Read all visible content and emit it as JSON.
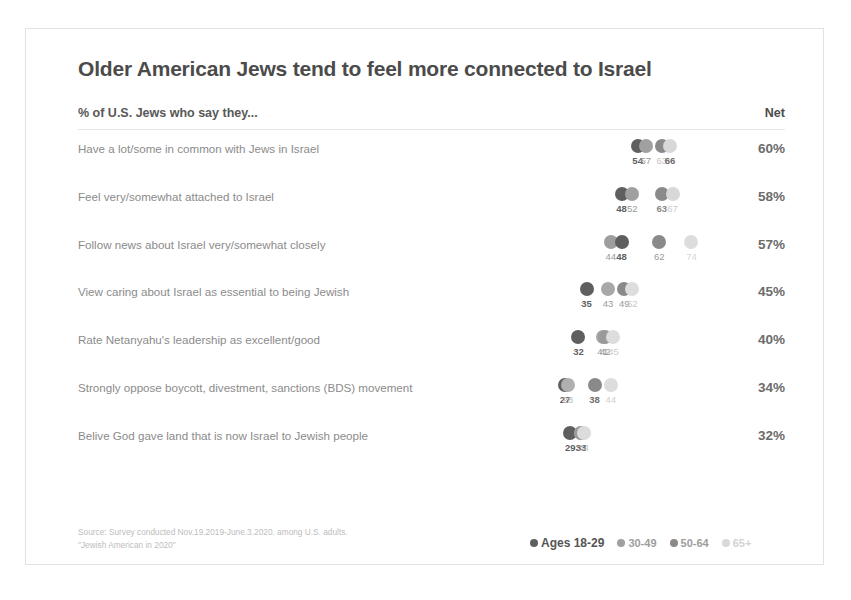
{
  "card": {
    "title": "Older American Jews tend to feel more connected to Israel",
    "subhead": "% of U.S. Jews who say they...",
    "net_header": "Net",
    "source_line1": "Source: Survey conducted Nov.19.2019-June.3.2020. among U.S. adults.",
    "source_line2": "\"Jewish American in 2020\""
  },
  "legend": {
    "items": [
      {
        "label": "Ages 18-29",
        "color": "#5f5f5f"
      },
      {
        "label": "30-49",
        "color": "#a0a0a0"
      },
      {
        "label": "50-64",
        "color": "#8a8a8a"
      },
      {
        "label": "65+",
        "color": "#d8d8d8"
      }
    ]
  },
  "chart_data": {
    "type": "scatter",
    "title": "Older American Jews tend to feel more connected to Israel",
    "subtitle": "% of U.S. Jews who say they...",
    "xlabel": "",
    "ylabel": "",
    "xlim": [
      0,
      100
    ],
    "grid": false,
    "legend_position": "bottom-right",
    "series": [
      {
        "name": "Ages 18-29",
        "color": "#5f5f5f",
        "values": [
          54,
          48,
          44,
          35,
          32,
          27,
          29
        ]
      },
      {
        "name": "30-49",
        "color": "#a0a0a0",
        "values": [
          57,
          52,
          48,
          43,
          41,
          28,
          33
        ]
      },
      {
        "name": "50-64",
        "color": "#8a8a8a",
        "values": [
          63,
          63,
          62,
          49,
          42,
          38,
          33
        ]
      },
      {
        "name": "65+",
        "color": "#d8d8d8",
        "values": [
          66,
          67,
          74,
          52,
          45,
          44,
          34
        ]
      }
    ],
    "categories": [
      "Have a lot/some in common with Jews in Israel",
      "Feel very/somewhat attached to Israel",
      "Follow news about Israel very/somewhat closely",
      "View caring about Israel as essential to being Jewish",
      "Rate Netanyahu's leadership as excellent/good",
      "Strongly oppose boycott, divestment, sanctions (BDS) movement",
      "Belive God gave land that is now Israel to Jewish people"
    ],
    "net": [
      "60%",
      "58%",
      "57%",
      "45%",
      "40%",
      "34%",
      "32%"
    ]
  },
  "rows": [
    {
      "label": "Have a lot/some in common with Jews in Israel",
      "net": "60%",
      "points": [
        {
          "group": "Ages 18-29",
          "value": 54,
          "color": "#5f5f5f",
          "label": "54",
          "label_color": "#5f5f5f",
          "bold": true
        },
        {
          "group": "30-49",
          "value": 57,
          "color": "#a0a0a0",
          "label": "57",
          "label_color": "#9a9a9a",
          "bold": false
        },
        {
          "group": "50-64",
          "value": 63,
          "color": "#8a8a8a",
          "label": "63",
          "label_color": "#c4c4c4",
          "bold": false
        },
        {
          "group": "65+",
          "value": 66,
          "color": "#d8d8d8",
          "label": "66",
          "label_color": "#6c6c6c",
          "bold": true
        }
      ]
    },
    {
      "label": "Feel very/somewhat attached to Israel",
      "net": "58%",
      "points": [
        {
          "group": "Ages 18-29",
          "value": 48,
          "color": "#5f5f5f",
          "label": "48",
          "label_color": "#5f5f5f",
          "bold": true
        },
        {
          "group": "30-49",
          "value": 52,
          "color": "#a0a0a0",
          "label": "52",
          "label_color": "#9a9a9a",
          "bold": false
        },
        {
          "group": "50-64",
          "value": 63,
          "color": "#8a8a8a",
          "label": "63",
          "label_color": "#8a8a8a",
          "bold": true
        },
        {
          "group": "65+",
          "value": 67,
          "color": "#d8d8d8",
          "label": "67",
          "label_color": "#cccccc",
          "bold": false
        }
      ]
    },
    {
      "label": "Follow news about Israel very/somewhat closely",
      "net": "57%",
      "points": [
        {
          "group": "Ages 18-29",
          "value": 44,
          "color": "#9e9e9e",
          "label": "44",
          "label_color": "#9a9a9a",
          "bold": false
        },
        {
          "group": "30-49",
          "value": 48,
          "color": "#5f5f5f",
          "label": "48",
          "label_color": "#5f5f5f",
          "bold": true
        },
        {
          "group": "50-64",
          "value": 62,
          "color": "#8a8a8a",
          "label": "62",
          "label_color": "#9a9a9a",
          "bold": false
        },
        {
          "group": "65+",
          "value": 74,
          "color": "#dddddd",
          "label": "74",
          "label_color": "#d5d5d5",
          "bold": false
        }
      ]
    },
    {
      "label": "View caring about Israel as essential to being Jewish",
      "net": "45%",
      "points": [
        {
          "group": "Ages 18-29",
          "value": 35,
          "color": "#5f5f5f",
          "label": "35",
          "label_color": "#5f5f5f",
          "bold": true
        },
        {
          "group": "30-49",
          "value": 43,
          "color": "#a8a8a8",
          "label": "43",
          "label_color": "#9a9a9a",
          "bold": false
        },
        {
          "group": "50-64",
          "value": 49,
          "color": "#8a8a8a",
          "label": "49",
          "label_color": "#9a9a9a",
          "bold": false
        },
        {
          "group": "65+",
          "value": 52,
          "color": "#dddddd",
          "label": "52",
          "label_color": "#c8c8c8",
          "bold": false
        }
      ]
    },
    {
      "label": "Rate Netanyahu's leadership as excellent/good",
      "net": "40%",
      "points": [
        {
          "group": "Ages 18-29",
          "value": 32,
          "color": "#5f5f5f",
          "label": "32",
          "label_color": "#5f5f5f",
          "bold": true
        },
        {
          "group": "30-49",
          "value": 41,
          "color": "#a8a8a8",
          "label": "41",
          "label_color": "#9a9a9a",
          "bold": false
        },
        {
          "group": "50-64",
          "value": 42,
          "color": "#9a9a9a",
          "label": "42",
          "label_color": "#9a9a9a",
          "bold": false
        },
        {
          "group": "65+",
          "value": 45,
          "color": "#dddddd",
          "label": "45",
          "label_color": "#cccccc",
          "bold": false
        }
      ]
    },
    {
      "label": "Strongly oppose boycott, divestment, sanctions (BDS) movement",
      "net": "34%",
      "points": [
        {
          "group": "Ages 18-29",
          "value": 27,
          "color": "#5f5f5f",
          "label": "27",
          "label_color": "#5f5f5f",
          "bold": true
        },
        {
          "group": "30-49",
          "value": 28,
          "color": "#b0b0b0",
          "label": "28",
          "label_color": "#b5b5b5",
          "bold": false
        },
        {
          "group": "50-64",
          "value": 38,
          "color": "#8a8a8a",
          "label": "38",
          "label_color": "#6c6c6c",
          "bold": true
        },
        {
          "group": "65+",
          "value": 44,
          "color": "#dddddd",
          "label": "44",
          "label_color": "#d0d0d0",
          "bold": false
        }
      ]
    },
    {
      "label": "Belive God gave land that is now Israel to Jewish people",
      "net": "32%",
      "points": [
        {
          "group": "Ages 18-29",
          "value": 29,
          "color": "#5f5f5f",
          "label": "29",
          "label_color": "#5f5f5f",
          "bold": true
        },
        {
          "group": "30-49",
          "value": 33,
          "color": "#a8a8a8",
          "label": "33",
          "label_color": "#6c6c6c",
          "bold": true
        },
        {
          "group": "50-64",
          "value": 33,
          "color": "#9a9a9a",
          "label": "33",
          "label_color": "#6c6c6c",
          "bold": true
        },
        {
          "group": "65+",
          "value": 34,
          "color": "#dcdcdc",
          "label": "34",
          "label_color": "#cccccc",
          "bold": false
        }
      ]
    }
  ]
}
